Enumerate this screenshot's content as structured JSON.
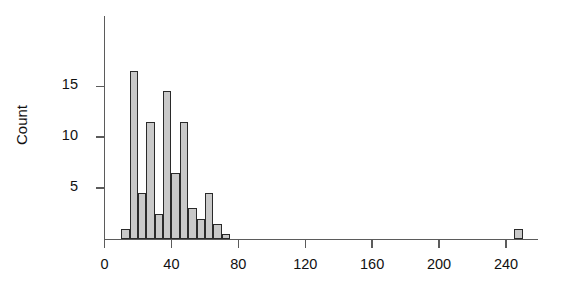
{
  "chart_data": {
    "type": "bar",
    "title": "",
    "subtitle": "",
    "xlabel": "",
    "ylabel": "Count",
    "xlim": [
      -8,
      270
    ],
    "ylim": [
      0,
      18
    ],
    "grid": false,
    "legend": null,
    "x_ticks": [
      0,
      40,
      80,
      120,
      160,
      200,
      240
    ],
    "y_ticks": [
      5,
      10,
      15
    ],
    "bin_width": 5,
    "bins": [
      {
        "x0": 10,
        "x1": 15,
        "value": 1
      },
      {
        "x0": 15,
        "x1": 20,
        "value": 16.5
      },
      {
        "x0": 20,
        "x1": 25,
        "value": 4.5
      },
      {
        "x0": 25,
        "x1": 30,
        "value": 11.5
      },
      {
        "x0": 30,
        "x1": 35,
        "value": 2.5
      },
      {
        "x0": 35,
        "x1": 40,
        "value": 14.5
      },
      {
        "x0": 40,
        "x1": 45,
        "value": 6.5
      },
      {
        "x0": 45,
        "x1": 50,
        "value": 11.5
      },
      {
        "x0": 50,
        "x1": 55,
        "value": 3
      },
      {
        "x0": 55,
        "x1": 60,
        "value": 2
      },
      {
        "x0": 60,
        "x1": 65,
        "value": 4.5
      },
      {
        "x0": 65,
        "x1": 70,
        "value": 1.5
      },
      {
        "x0": 70,
        "x1": 75,
        "value": 0.5
      },
      {
        "x0": 245,
        "x1": 250,
        "value": 1
      }
    ],
    "categories": [
      "10-15",
      "15-20",
      "20-25",
      "25-30",
      "30-35",
      "35-40",
      "40-45",
      "45-50",
      "50-55",
      "55-60",
      "60-65",
      "65-70",
      "70-75",
      "245-250"
    ],
    "values": [
      1,
      16.5,
      4.5,
      11.5,
      2.5,
      14.5,
      6.5,
      11.5,
      3,
      2,
      4.5,
      1.5,
      0.5,
      1
    ],
    "colors": {
      "bar_fill": "#c9c9c9",
      "bar_stroke": "#2a2a2a",
      "axis": "#5b5b5b",
      "text": "#111111",
      "background": "#ffffff"
    }
  }
}
